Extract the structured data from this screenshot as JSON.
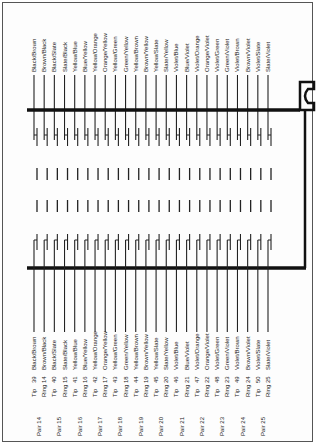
{
  "diagram": {
    "pairs": [
      {
        "pair": "Pair 14",
        "tip_pin": "39",
        "tip_color": "Black/Brown",
        "ring_pin": "14",
        "ring_color": "Brown/Black"
      },
      {
        "pair": "Pair 15",
        "tip_pin": "40",
        "tip_color": "Black/Slate",
        "ring_pin": "15",
        "ring_color": "Slate/Black"
      },
      {
        "pair": "Pair 16",
        "tip_pin": "41",
        "tip_color": "Yellow/Blue",
        "ring_pin": "16",
        "ring_color": "Blue/Yellow"
      },
      {
        "pair": "Pair 17",
        "tip_pin": "42",
        "tip_color": "Yellow/Orange",
        "ring_pin": "17",
        "ring_color": "Orange/Yellow"
      },
      {
        "pair": "Pair 18",
        "tip_pin": "43",
        "tip_color": "Yellow/Green",
        "ring_pin": "18",
        "ring_color": "Green/Yellow"
      },
      {
        "pair": "Pair 19",
        "tip_pin": "44",
        "tip_color": "Yellow/Brown",
        "ring_pin": "19",
        "ring_color": "Brown/Yellow"
      },
      {
        "pair": "Pair 20",
        "tip_pin": "45",
        "tip_color": "Yellow/Slate",
        "ring_pin": "20",
        "ring_color": "Slate/Yellow"
      },
      {
        "pair": "Pair 21",
        "tip_pin": "46",
        "tip_color": "Violet/Blue",
        "ring_pin": "21",
        "ring_color": "Blue/Violet"
      },
      {
        "pair": "Pair 22",
        "tip_pin": "47",
        "tip_color": "Violet/Orange",
        "ring_pin": "22",
        "ring_color": "Orange/Violet"
      },
      {
        "pair": "Pair 23",
        "tip_pin": "48",
        "tip_color": "Violet/Green",
        "ring_pin": "23",
        "ring_color": "Green/Violet"
      },
      {
        "pair": "Pair 24",
        "tip_pin": "49",
        "tip_color": "Violet/Brown",
        "ring_pin": "24",
        "ring_color": "Brown/Violet"
      },
      {
        "pair": "Pair 25",
        "tip_pin": "50",
        "tip_color": "Violet/Slate",
        "ring_pin": "25",
        "ring_color": "Slate/Violet"
      }
    ],
    "tip_label": "Tip",
    "ring_label": "Ring",
    "top_colors": [
      "Black/Brown",
      "Brown/Black",
      "Black/Slate",
      "Slate/Black",
      "Yellow/Blue",
      "Blue/Yellow",
      "Yellow/Orange",
      "Orange/Yellow",
      "Yellow/Green",
      "Green/Yellow",
      "Yellow/Brown",
      "Brown/Yellow",
      "Yellow/Slate",
      "Slate/Yellow",
      "Violet/Blue",
      "Blue/Violet",
      "Violet/Orange",
      "Orange/Violet",
      "Violet/Green",
      "Green/Violet",
      "Violet/Brown",
      "Brown/Violet",
      "Violet/Slate",
      "Slate/Violet"
    ]
  }
}
